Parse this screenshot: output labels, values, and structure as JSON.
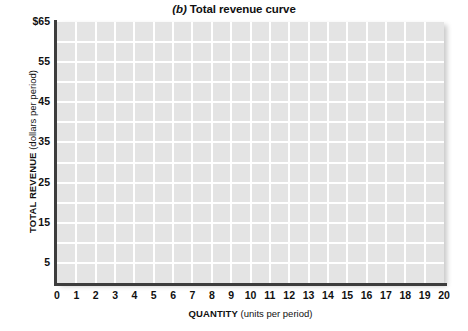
{
  "chart_data": {
    "type": "line",
    "title": "(b) Total revenue curve",
    "title_parts": {
      "panel_letter": "(b)",
      "rest": " Total revenue curve"
    },
    "xlabel": "QUANTITY",
    "xlabel_units": "(units per period)",
    "ylabel": "TOTAL REVENUE",
    "ylabel_units": "(dollars per period)",
    "xlim": [
      0,
      20
    ],
    "ylim": [
      0,
      65
    ],
    "x_ticks": [
      0,
      1,
      2,
      3,
      4,
      5,
      6,
      7,
      8,
      9,
      10,
      11,
      12,
      13,
      14,
      15,
      16,
      17,
      18,
      19,
      20
    ],
    "x_tick_labels": [
      "0",
      "1",
      "2",
      "3",
      "4",
      "5",
      "6",
      "7",
      "8",
      "9",
      "10",
      "11",
      "12",
      "13",
      "14",
      "15",
      "16",
      "17",
      "18",
      "19",
      "20"
    ],
    "y_ticks": [
      5,
      15,
      25,
      35,
      45,
      55,
      65
    ],
    "y_tick_labels": [
      "5",
      "15",
      "25",
      "35",
      "45",
      "55",
      "$65"
    ],
    "grid": true,
    "grid_x_step": 1,
    "grid_y_step": 5,
    "legend": null,
    "series": [],
    "values": [],
    "annotations": [],
    "colors": {
      "plot_background": "#e4e4e4",
      "gridline": "#ffffff",
      "axis_line": "#3d3d3d",
      "text": "#111111",
      "page_background": "#ffffff"
    }
  }
}
